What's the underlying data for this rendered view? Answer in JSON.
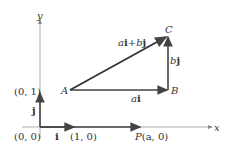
{
  "axes": {
    "x_label": "x",
    "y_label": "y"
  },
  "points": {
    "origin": "(0, 0)",
    "unit_y": "(0, 1)",
    "unit_x": "(1, 0)",
    "A": "A",
    "B": "B",
    "C": "C",
    "P_name": "P",
    "P_coords": "(a, 0)"
  },
  "vectors": {
    "i": "i",
    "j": "j",
    "ai_a": "a",
    "ai_i": "i",
    "bj_b": "b",
    "bj_j": "j",
    "sum_a": "a",
    "sum_i": "i",
    "sum_plus": "+",
    "sum_b": "b",
    "sum_j": "j"
  },
  "colors": {
    "axis": "#888888",
    "vector": "#444444",
    "text": "#333333"
  }
}
